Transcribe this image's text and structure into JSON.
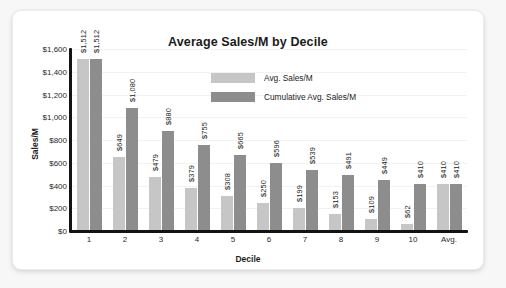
{
  "chart_data": {
    "type": "bar",
    "title": "Average Sales/M by Decile",
    "xlabel": "Decile",
    "ylabel": "Sales/M",
    "categories": [
      "1",
      "2",
      "3",
      "4",
      "5",
      "6",
      "7",
      "8",
      "9",
      "10",
      "Avg."
    ],
    "series": [
      {
        "name": "Avg. Sales/M",
        "color": "#c6c6c6",
        "values": [
          1512,
          649,
          479,
          379,
          308,
          250,
          199,
          153,
          109,
          62,
          410
        ],
        "labels": [
          "$1,512",
          "$649",
          "$479",
          "$379",
          "$308",
          "$250",
          "$199",
          "$153",
          "$109",
          "$62",
          "$410"
        ]
      },
      {
        "name": "Cumulative Avg. Sales/M",
        "color": "#8d8d8d",
        "values": [
          1512,
          1080,
          880,
          755,
          665,
          596,
          539,
          491,
          449,
          410,
          410
        ],
        "labels": [
          "$1,512",
          "$1,080",
          "$880",
          "$755",
          "$665",
          "$596",
          "$539",
          "$491",
          "$449",
          "$410",
          "$410"
        ]
      }
    ],
    "ylim": [
      0,
      1600
    ],
    "yticks": [
      0,
      200,
      400,
      600,
      800,
      1000,
      1200,
      1400,
      1600
    ],
    "ytick_labels": [
      "$0",
      "$200",
      "$400",
      "$600",
      "$800",
      "$1,000",
      "$1,200",
      "$1,400",
      "$1,600"
    ],
    "grid": true,
    "legend_position": "inside-top-center"
  },
  "legend": {
    "items": [
      {
        "label": "Avg. Sales/M"
      },
      {
        "label": "Cumulative Avg. Sales/M"
      }
    ]
  }
}
